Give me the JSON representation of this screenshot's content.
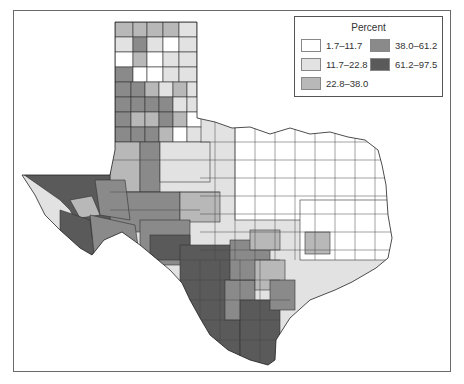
{
  "map": {
    "region": "Texas counties",
    "legend": {
      "title": "Percent",
      "items": [
        {
          "label": "1.7–11.7",
          "color": "#ffffff"
        },
        {
          "label": "11.7–22.8",
          "color": "#e2e2e2"
        },
        {
          "label": "22.8–38.0",
          "color": "#b8b8b8"
        },
        {
          "label": "38.0–61.2",
          "color": "#8a8a8a"
        },
        {
          "label": "61.2–97.5",
          "color": "#5a5a5a"
        }
      ]
    },
    "regional_pattern": {
      "panhandle": "mixed 11.7–61.2",
      "west_trans_pecos": "61.2–97.5 and 38.0–61.2",
      "south_border_rio_grande": "61.2–97.5",
      "central": "11.7–22.8",
      "east_northeast": "1.7–11.7"
    }
  }
}
